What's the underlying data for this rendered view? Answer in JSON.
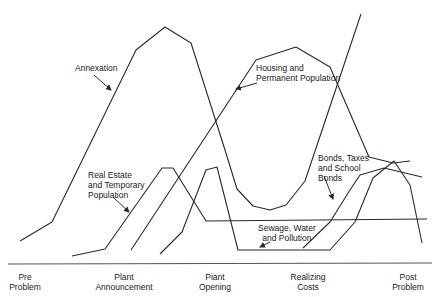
{
  "diagram": {
    "line_color": "#2a2a2a",
    "stages": [
      {
        "label": "Pre\nProblem",
        "x": 25
      },
      {
        "label": "Plant\nAnnouncement",
        "x": 124
      },
      {
        "label": "Piant\nOpening",
        "x": 215
      },
      {
        "label": "Realizing\nCosts",
        "x": 308
      },
      {
        "label": "Post\nProblem",
        "x": 408
      }
    ],
    "axis": {
      "x1": 8,
      "y1": 264,
      "x2": 432,
      "y2": 263
    },
    "curves": [
      {
        "name": "annexation",
        "label": "Annexation",
        "points": "20,241 52,222 136,50 165,27 191,43 225,150 237,189 253,206 270,210 286,205 305,181 361,14"
      },
      {
        "name": "housing-permanent-population",
        "label": "Housing and\nPermanent Population",
        "points": "131,250 256,60 296,47 330,67 369,157 393,163 410,161"
      },
      {
        "name": "real-estate-temporary-population",
        "label": "Real Estate\nand Temporary\nPopulation",
        "points": "72,256 105,249 162,168 173,168 206,221 427,219"
      },
      {
        "name": "sewage-water-pollution",
        "label": "Sewage, Water\nand Pollution",
        "points": "160,254 182,232 206,170 217,167 238,250 330,250 355,222 373,178 394,161 410,185 422,243"
      },
      {
        "name": "bonds-taxes-school-bonds",
        "label": "Bonds, Taxes\nand School\nBonds",
        "points": "303,248 330,222 350,190 360,175 384,168 422,177"
      }
    ],
    "labels": [
      {
        "text": "Annexation",
        "x": 75,
        "y": 63
      },
      {
        "text": "Housing and\nPermanent Population",
        "x": 256,
        "y": 63
      },
      {
        "text": "Real Estate\nand Temporary\nPopulation",
        "x": 88,
        "y": 170
      },
      {
        "text": "Bonds, Taxes\nand School\nBonds",
        "x": 318,
        "y": 153
      },
      {
        "text": "Sewage, Water\nand Pollution",
        "x": 258,
        "y": 223
      }
    ],
    "arrows": [
      {
        "name": "annexation-arrow",
        "x1": 94,
        "y1": 75,
        "x2": 111,
        "y2": 90
      },
      {
        "name": "housing-arrow",
        "x1": 257,
        "y1": 83,
        "x2": 236,
        "y2": 89
      },
      {
        "name": "real-estate-arrow",
        "x1": 113,
        "y1": 197,
        "x2": 129,
        "y2": 212
      },
      {
        "name": "bonds-arrow",
        "x1": 324,
        "y1": 176,
        "x2": 333,
        "y2": 199
      },
      {
        "name": "sewage-arrow",
        "x1": 270,
        "y1": 242,
        "x2": 260,
        "y2": 247
      }
    ]
  }
}
